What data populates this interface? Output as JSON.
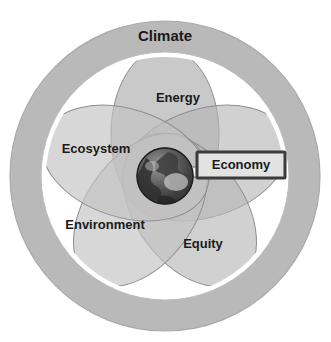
{
  "diagram": {
    "type": "venn-petal-concentric",
    "title_label": "Climate",
    "center_icon": "earth-globe-icon",
    "outer_ring": {
      "label": "Climate",
      "fill": "#b9b9b9",
      "stroke": "#a2a2a2"
    },
    "gap_ring": {
      "fill": "#ffffff"
    },
    "petals": [
      {
        "id": "energy",
        "label": "Energy",
        "bold": true,
        "fill": "#bdbdbd",
        "stroke": "#8f8f8f",
        "label_x": 178,
        "label_y": 99,
        "font_size": 13
      },
      {
        "id": "ecosystem",
        "label": "Ecosystem",
        "bold": true,
        "fill": "#c9c9c9",
        "stroke": "#8f8f8f",
        "label_x": 96,
        "label_y": 150,
        "font_size": 13
      },
      {
        "id": "environment",
        "label": "Environment",
        "bold": false,
        "fill": "#c9c9c9",
        "stroke": "#8f8f8f",
        "label_x": 105,
        "label_y": 226,
        "font_size": 13
      },
      {
        "id": "equity",
        "label": "Equity",
        "bold": true,
        "fill": "#bdbdbd",
        "stroke": "#8f8f8f",
        "label_x": 203,
        "label_y": 245,
        "font_size": 13
      },
      {
        "id": "economy-petal",
        "label": "",
        "bold": false,
        "fill": "#c4c4c4",
        "stroke": "#8f8f8f",
        "label_x": 0,
        "label_y": 0,
        "font_size": 13
      }
    ],
    "callout": {
      "label": "Economy",
      "border_color": "#3b3b3b",
      "fill": "#e2e2e2",
      "text_color": "#1a1a1a"
    },
    "colors": {
      "background": "#ffffff",
      "ring": "#b9b9b9",
      "petal_light": "#c9c9c9",
      "petal_dark": "#b0b0b0",
      "outline": "#8f8f8f",
      "text": "#1a1a1a",
      "globe_dark": "#3a3a3a",
      "globe_light": "#cfcfcf"
    }
  }
}
